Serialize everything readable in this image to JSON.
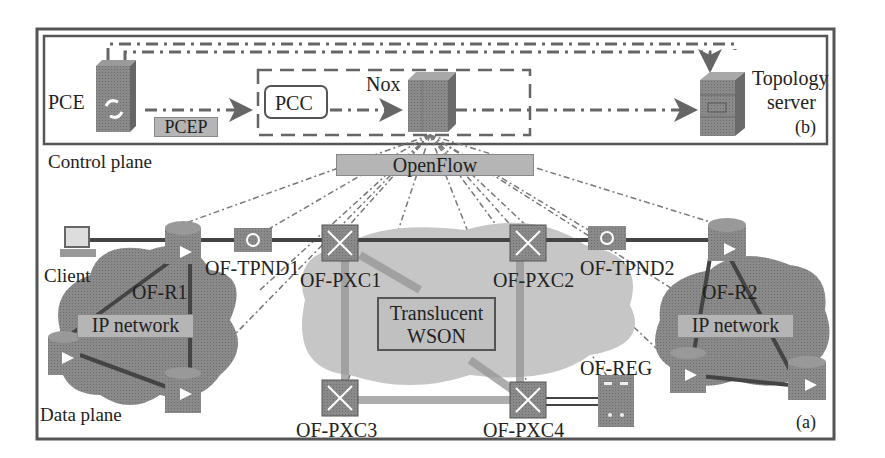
{
  "control_plane": {
    "label": "Control plane",
    "panel_tag": "(b)",
    "nodes": {
      "pce": "PCE",
      "pcep": "PCEP",
      "pcc": "PCC",
      "nox": "Nox",
      "topology_server_line1": "Topology",
      "topology_server_line2": "server"
    },
    "openflow": "OpenFlow"
  },
  "data_plane": {
    "label": "Data plane",
    "panel_tag": "(a)",
    "nodes": {
      "client": "Client",
      "of_r1": "OF-R1",
      "of_tpnd1": "OF-TPND1",
      "of_pxc1": "OF-PXC1",
      "of_pxc2": "OF-PXC2",
      "of_tpnd2": "OF-TPND2",
      "of_r2": "OF-R2",
      "of_pxc3": "OF-PXC3",
      "of_pxc4": "OF-PXC4",
      "of_reg": "OF-REG"
    },
    "domains": {
      "ip_network_left": "IP network",
      "ip_network_right": "IP network",
      "wson_line1": "Translucent",
      "wson_line2": "WSON"
    }
  },
  "colors": {
    "frame": "#555555",
    "device": "#7a7a7a",
    "cloud": "#9a9a9a",
    "cloud_light": "#c8c8c8",
    "label_box": "#b5b5b5",
    "link": "#444444"
  }
}
